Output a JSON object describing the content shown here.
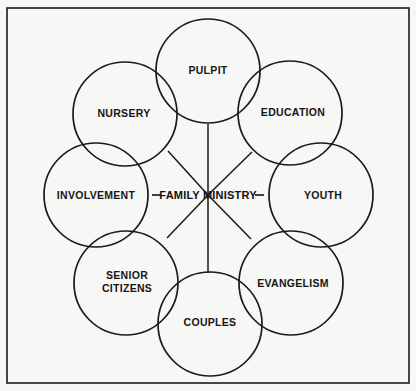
{
  "figure": {
    "kind": "concentric-overlapping-circles-diagram",
    "background_color": "#f7f7f5",
    "stroke_color": "#1a1a1a",
    "text_color": "#151515",
    "frame": {
      "name": "outer-border",
      "x": 7,
      "y": 8,
      "width": 402,
      "height": 375,
      "stroke_width": 1.6
    },
    "center": {
      "label": "FAMILY MINISTRY",
      "prefix_dash": "–",
      "suffix_dash": "–",
      "display": "– FAMILY MINISTRY –",
      "x": 208,
      "y": 195
    },
    "circle_radius": 52,
    "ring_radius": 89,
    "nodes": [
      {
        "id": "pulpit",
        "label": "PULPIT",
        "lines": [
          "PULPIT"
        ],
        "cx": 208,
        "cy": 71,
        "label_x": 208,
        "label_y": 70,
        "angle_deg": 270
      },
      {
        "id": "education",
        "label": "EDUCATION",
        "lines": [
          "EDUCATION"
        ],
        "cx": 290,
        "cy": 113,
        "label_x": 293,
        "label_y": 112,
        "angle_deg": 315
      },
      {
        "id": "youth",
        "label": "YOUTH",
        "lines": [
          "YOUTH"
        ],
        "cx": 321,
        "cy": 195,
        "label_x": 323,
        "label_y": 195,
        "angle_deg": 0
      },
      {
        "id": "evangelism",
        "label": "EVANGELISM",
        "lines": [
          "EVANGELISM"
        ],
        "cx": 291,
        "cy": 283,
        "label_x": 293,
        "label_y": 283,
        "angle_deg": 45
      },
      {
        "id": "couples",
        "label": "COUPLES",
        "lines": [
          "COUPLES"
        ],
        "cx": 210,
        "cy": 324,
        "label_x": 210,
        "label_y": 322,
        "angle_deg": 90
      },
      {
        "id": "senior-citizens",
        "label": "SENIOR CITIZENS",
        "lines": [
          "SENIOR",
          "CITIZENS"
        ],
        "cx": 126,
        "cy": 283,
        "label_x": 127,
        "label_y": 281,
        "angle_deg": 135
      },
      {
        "id": "involvement",
        "label": "INVOLVEMENT",
        "lines": [
          "INVOLVEMENT"
        ],
        "cx": 96,
        "cy": 195,
        "label_x": 96,
        "label_y": 195,
        "angle_deg": 180
      },
      {
        "id": "nursery",
        "label": "NURSERY",
        "lines": [
          "NURSERY"
        ],
        "cx": 125,
        "cy": 114,
        "label_x": 124,
        "label_y": 113,
        "angle_deg": 225
      }
    ],
    "spokes": [
      {
        "id": "spoke-pulpit",
        "x1": 208,
        "y1": 195,
        "x2": 208,
        "y2": 124
      },
      {
        "id": "spoke-education",
        "x1": 208,
        "y1": 195,
        "x2": 252,
        "y2": 152
      },
      {
        "id": "spoke-evangelism",
        "x1": 208,
        "y1": 195,
        "x2": 251,
        "y2": 239
      },
      {
        "id": "spoke-couples",
        "x1": 208,
        "y1": 195,
        "x2": 208,
        "y2": 273
      },
      {
        "id": "spoke-senior-citizens",
        "x1": 208,
        "y1": 195,
        "x2": 167,
        "y2": 238
      },
      {
        "id": "spoke-nursery",
        "x1": 208,
        "y1": 195,
        "x2": 168,
        "y2": 151
      }
    ]
  }
}
